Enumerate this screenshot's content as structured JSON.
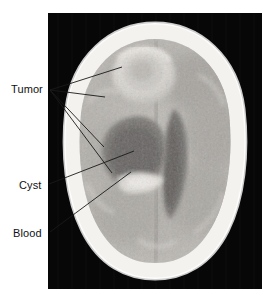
{
  "figure": {
    "kind": "annotated-medical-image",
    "modality": "CT",
    "view": "axial brain slice",
    "width": 273,
    "height": 305,
    "background_color": "#ffffff"
  },
  "image_panel": {
    "name": "ct-brain-scan",
    "x": 48,
    "y": 13,
    "width": 214,
    "height": 276,
    "background_color": "#070707",
    "description": "Axial computed tomography slice of the head showing a bright skull ring, mottled brain parenchyma, a ring-enhancing mass in the right frontal region, a dark low-density cystic cavity, and a dark midline ventricular system."
  },
  "annotations": [
    {
      "id": "tumor",
      "label": "Tumor",
      "label_x": 11,
      "label_y": 84,
      "anchor_x": 50,
      "anchor_y": 90,
      "leader_count": 4,
      "targets": [
        {
          "x": 122,
          "y": 67
        },
        {
          "x": 105,
          "y": 97
        },
        {
          "x": 104,
          "y": 147
        },
        {
          "x": 112,
          "y": 173
        }
      ]
    },
    {
      "id": "cyst",
      "label": "Cyst",
      "label_x": 19,
      "label_y": 180,
      "anchor_x": 49,
      "anchor_y": 184,
      "leader_count": 1,
      "targets": [
        {
          "x": 134,
          "y": 151
        }
      ]
    },
    {
      "id": "blood",
      "label": "Blood",
      "label_x": 13,
      "label_y": 228,
      "anchor_x": 50,
      "anchor_y": 232,
      "leader_count": 1,
      "targets": [
        {
          "x": 131,
          "y": 172
        }
      ]
    }
  ],
  "colors": {
    "label_text": "#111111",
    "leader_line": "#1a1a1a",
    "panel_background": "#070707",
    "skull_bright": "#f2f0ec",
    "brain_mid": "#b9b6b1",
    "brain_dark": "#8f8c88",
    "cavity_dark": "#6e6b68",
    "tumor_bright": "#e8e5e0"
  }
}
